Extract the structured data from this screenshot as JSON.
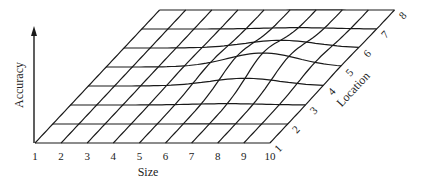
{
  "chart_data": {
    "type": "surface",
    "title": "",
    "xlabel": "Size",
    "ylabel": "Location",
    "zlabel": "Accuracy",
    "x_ticks": [
      "1",
      "2",
      "3",
      "4",
      "5",
      "6",
      "7",
      "8",
      "9",
      "10"
    ],
    "y_ticks": [
      "1",
      "2",
      "3",
      "4",
      "5",
      "6",
      "7",
      "8"
    ],
    "grid": true,
    "peak": {
      "size": 7,
      "location": 5,
      "relative_height": 1.0
    },
    "ink_color": "#1a1a1a"
  },
  "labels": {
    "size_axis": "Size",
    "location_axis": "Location",
    "accuracy_axis": "Accuracy"
  }
}
